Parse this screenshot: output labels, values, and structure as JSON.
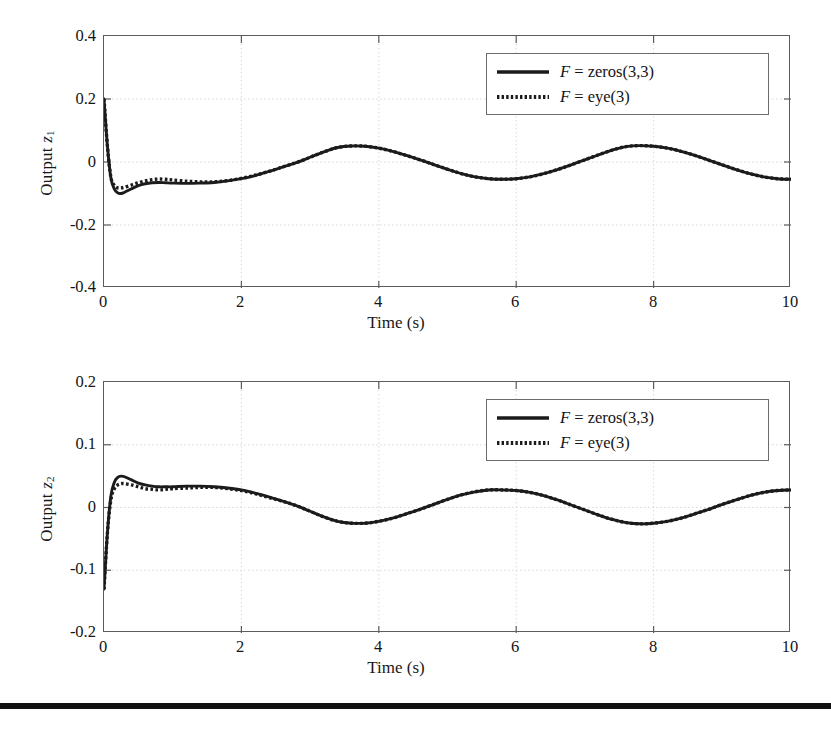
{
  "figure": {
    "background_color": "#ffffff",
    "line_color": "#1b1b1b",
    "grid_color": "#cfcfcf",
    "axis_color": "#5c5c5c"
  },
  "bottom_rule": {
    "name": "page-divider-rule",
    "color": "#111111"
  },
  "charts": [
    {
      "id": "chart-output-z1",
      "ylabel_prefix": "Output ",
      "ylabel_var": "z",
      "ylabel_sub": "1",
      "xlabel": "Time (s)",
      "yticks": [
        "0.4",
        "0.2",
        "0",
        "-0.2",
        "-0.4"
      ],
      "xticks": [
        "0",
        "2",
        "4",
        "6",
        "8",
        "10"
      ],
      "legend": [
        {
          "label_pre": "F",
          "label_post": " = zeros(3,3)",
          "style": "solid"
        },
        {
          "label_pre": "F",
          "label_post": " = eye(3)",
          "style": "dotted"
        }
      ]
    },
    {
      "id": "chart-output-z2",
      "ylabel_prefix": "Output ",
      "ylabel_var": "z",
      "ylabel_sub": "2",
      "xlabel": "Time (s)",
      "yticks": [
        "0.2",
        "0.1",
        "0",
        "-0.1",
        "-0.2"
      ],
      "xticks": [
        "0",
        "2",
        "4",
        "6",
        "8",
        "10"
      ],
      "legend": [
        {
          "label_pre": "F",
          "label_post": " = zeros(3,3)",
          "style": "solid"
        },
        {
          "label_pre": "F",
          "label_post": " = eye(3)",
          "style": "dotted"
        }
      ]
    }
  ],
  "chart_data": [
    {
      "type": "line",
      "title": "",
      "xlabel": "Time (s)",
      "ylabel": "Output z1",
      "xlim": [
        0,
        10
      ],
      "ylim": [
        -0.4,
        0.4
      ],
      "xticks": [
        0,
        2,
        4,
        6,
        8,
        10
      ],
      "yticks": [
        -0.4,
        -0.2,
        0,
        0.2,
        0.4
      ],
      "grid": true,
      "legend_position": "upper-right",
      "x": [
        0,
        0.05,
        0.1,
        0.15,
        0.2,
        0.25,
        0.3,
        0.4,
        0.5,
        0.6,
        0.7,
        0.8,
        0.9,
        1.0,
        1.2,
        1.4,
        1.6,
        1.8,
        2.0,
        2.2,
        2.4,
        2.6,
        2.8,
        3.0,
        3.2,
        3.4,
        3.6,
        3.8,
        4.0,
        4.2,
        4.4,
        4.6,
        4.8,
        5.0,
        5.2,
        5.4,
        5.6,
        5.8,
        6.0,
        6.2,
        6.4,
        6.6,
        6.8,
        7.0,
        7.2,
        7.4,
        7.6,
        7.8,
        8.0,
        8.2,
        8.4,
        8.6,
        8.8,
        9.0,
        9.2,
        9.4,
        9.6,
        9.8,
        10.0
      ],
      "series": [
        {
          "name": "F = zeros(3,3)",
          "style": "solid",
          "values": [
            0.2,
            0.05,
            -0.05,
            -0.085,
            -0.098,
            -0.1,
            -0.096,
            -0.085,
            -0.075,
            -0.069,
            -0.066,
            -0.065,
            -0.066,
            -0.067,
            -0.068,
            -0.067,
            -0.065,
            -0.06,
            -0.053,
            -0.043,
            -0.03,
            -0.016,
            -0.002,
            0.015,
            0.032,
            0.046,
            0.051,
            0.05,
            0.044,
            0.034,
            0.021,
            0.007,
            -0.008,
            -0.023,
            -0.037,
            -0.047,
            -0.053,
            -0.055,
            -0.053,
            -0.047,
            -0.037,
            -0.024,
            -0.009,
            0.007,
            0.023,
            0.038,
            0.049,
            0.052,
            0.05,
            0.044,
            0.034,
            0.021,
            0.006,
            -0.009,
            -0.024,
            -0.037,
            -0.047,
            -0.053,
            -0.055
          ]
        },
        {
          "name": "F = eye(3)",
          "style": "dotted",
          "values": [
            0.2,
            0.05,
            -0.048,
            -0.074,
            -0.082,
            -0.082,
            -0.08,
            -0.073,
            -0.066,
            -0.06,
            -0.056,
            -0.054,
            -0.055,
            -0.057,
            -0.061,
            -0.063,
            -0.063,
            -0.059,
            -0.052,
            -0.042,
            -0.03,
            -0.016,
            -0.002,
            0.015,
            0.032,
            0.046,
            0.051,
            0.05,
            0.044,
            0.034,
            0.021,
            0.007,
            -0.008,
            -0.023,
            -0.037,
            -0.047,
            -0.053,
            -0.055,
            -0.053,
            -0.047,
            -0.037,
            -0.024,
            -0.009,
            0.007,
            0.023,
            0.038,
            0.049,
            0.052,
            0.05,
            0.044,
            0.034,
            0.021,
            0.006,
            -0.009,
            -0.024,
            -0.037,
            -0.047,
            -0.053,
            -0.055
          ]
        }
      ]
    },
    {
      "type": "line",
      "title": "",
      "xlabel": "Time (s)",
      "ylabel": "Output z2",
      "xlim": [
        0,
        10
      ],
      "ylim": [
        -0.2,
        0.2
      ],
      "xticks": [
        0,
        2,
        4,
        6,
        8,
        10
      ],
      "yticks": [
        -0.2,
        -0.1,
        0,
        0.1,
        0.2
      ],
      "grid": true,
      "legend_position": "upper-right",
      "x": [
        0,
        0.05,
        0.1,
        0.15,
        0.2,
        0.25,
        0.3,
        0.4,
        0.5,
        0.6,
        0.7,
        0.8,
        0.9,
        1.0,
        1.2,
        1.4,
        1.6,
        1.8,
        2.0,
        2.2,
        2.4,
        2.6,
        2.8,
        3.0,
        3.2,
        3.4,
        3.6,
        3.8,
        4.0,
        4.2,
        4.4,
        4.6,
        4.8,
        5.0,
        5.2,
        5.4,
        5.6,
        5.8,
        6.0,
        6.2,
        6.4,
        6.6,
        6.8,
        7.0,
        7.2,
        7.4,
        7.6,
        7.8,
        8.0,
        8.2,
        8.4,
        8.6,
        8.8,
        9.0,
        9.2,
        9.4,
        9.6,
        9.8,
        10.0
      ],
      "series": [
        {
          "name": "F = zeros(3,3)",
          "style": "solid",
          "values": [
            -0.13,
            -0.04,
            0.018,
            0.04,
            0.048,
            0.05,
            0.049,
            0.044,
            0.039,
            0.036,
            0.034,
            0.033,
            0.033,
            0.033,
            0.034,
            0.034,
            0.033,
            0.031,
            0.028,
            0.023,
            0.017,
            0.01,
            0.003,
            -0.006,
            -0.015,
            -0.022,
            -0.025,
            -0.025,
            -0.022,
            -0.017,
            -0.01,
            -0.003,
            0.005,
            0.013,
            0.02,
            0.025,
            0.028,
            0.028,
            0.027,
            0.024,
            0.019,
            0.012,
            0.004,
            -0.004,
            -0.012,
            -0.019,
            -0.024,
            -0.026,
            -0.025,
            -0.022,
            -0.017,
            -0.01,
            -0.003,
            0.005,
            0.012,
            0.019,
            0.024,
            0.027,
            0.028
          ]
        },
        {
          "name": "F = eye(3)",
          "style": "dotted",
          "values": [
            -0.13,
            -0.04,
            0.012,
            0.03,
            0.036,
            0.038,
            0.038,
            0.036,
            0.033,
            0.03,
            0.029,
            0.028,
            0.029,
            0.03,
            0.031,
            0.032,
            0.032,
            0.03,
            0.027,
            0.022,
            0.016,
            0.01,
            0.003,
            -0.006,
            -0.015,
            -0.022,
            -0.025,
            -0.025,
            -0.022,
            -0.017,
            -0.01,
            -0.003,
            0.005,
            0.013,
            0.02,
            0.025,
            0.028,
            0.028,
            0.027,
            0.024,
            0.019,
            0.012,
            0.004,
            -0.004,
            -0.012,
            -0.019,
            -0.024,
            -0.026,
            -0.025,
            -0.022,
            -0.017,
            -0.01,
            -0.003,
            0.005,
            0.012,
            0.019,
            0.024,
            0.027,
            0.028
          ]
        }
      ]
    }
  ]
}
